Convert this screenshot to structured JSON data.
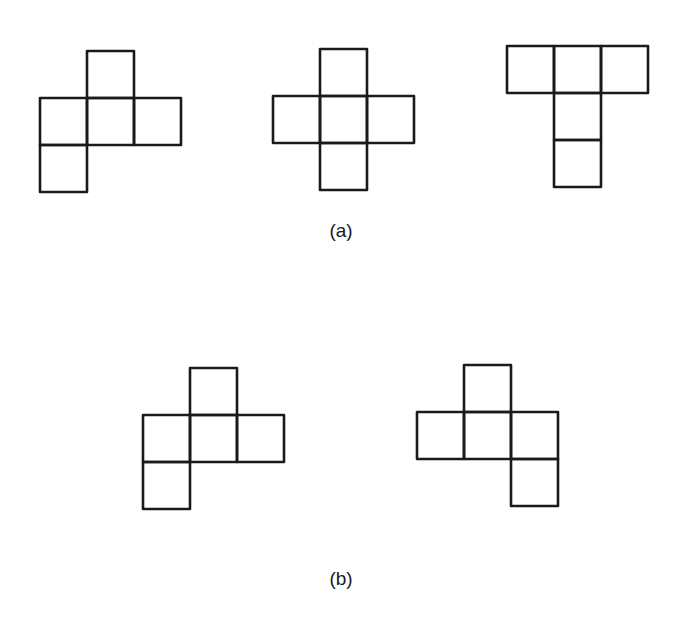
{
  "figure": {
    "stroke_color": "#1a1a1a",
    "stroke_width": 2.6,
    "cell_size": 47,
    "groups": [
      {
        "label": "(a)",
        "label_pos": [
          341,
          220
        ],
        "shapes": [
          {
            "name": "net-a1",
            "origin": [
              40,
              51
            ],
            "cells": [
              [
                1,
                0
              ],
              [
                0,
                1
              ],
              [
                1,
                1
              ],
              [
                2,
                1
              ],
              [
                0,
                2
              ]
            ]
          },
          {
            "name": "net-a2",
            "origin": [
              273,
              49
            ],
            "cells": [
              [
                1,
                0
              ],
              [
                0,
                1
              ],
              [
                1,
                1
              ],
              [
                2,
                1
              ],
              [
                1,
                2
              ]
            ]
          },
          {
            "name": "net-a3",
            "origin": [
              507,
              46
            ],
            "cells": [
              [
                0,
                0
              ],
              [
                1,
                0
              ],
              [
                2,
                0
              ],
              [
                1,
                1
              ],
              [
                1,
                2
              ]
            ]
          }
        ]
      },
      {
        "label": "(b)",
        "label_pos": [
          341,
          568
        ],
        "shapes": [
          {
            "name": "net-b1",
            "origin": [
              143,
              368
            ],
            "cells": [
              [
                1,
                0
              ],
              [
                0,
                1
              ],
              [
                1,
                1
              ],
              [
                2,
                1
              ],
              [
                0,
                2
              ]
            ]
          },
          {
            "name": "net-b2",
            "origin": [
              417,
              365
            ],
            "cells": [
              [
                1,
                0
              ],
              [
                0,
                1
              ],
              [
                1,
                1
              ],
              [
                2,
                1
              ],
              [
                2,
                2
              ]
            ]
          }
        ]
      }
    ]
  }
}
